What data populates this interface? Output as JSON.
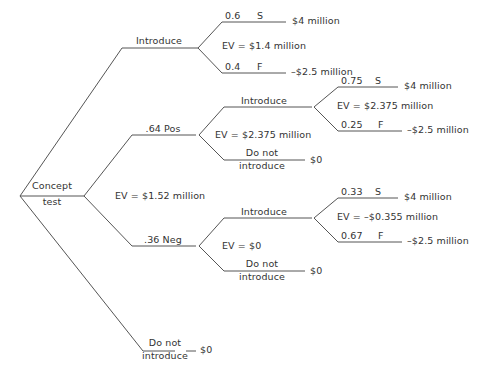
{
  "diagram": {
    "type": "decision-tree",
    "line_color": "#555555",
    "text_color": "#333333",
    "background": "#ffffff"
  },
  "nodes": {
    "root": {
      "label_line1": "Concept",
      "label_line2": "test"
    },
    "introduce_top": {
      "label": "Introduce"
    },
    "pos_branch": {
      "label": ".64 Pos"
    },
    "neg_branch": {
      "label": ".36 Neg"
    },
    "do_not_introduce_root": {
      "label_line1": "Do not",
      "label_line2": "introduce"
    },
    "introduce_pos": {
      "label": "Introduce"
    },
    "do_not_introduce_pos": {
      "label_line1": "Do not",
      "label_line2": "introduce"
    },
    "introduce_neg": {
      "label": "Introduce"
    },
    "do_not_introduce_neg": {
      "label_line1": "Do not",
      "label_line2": "introduce"
    }
  },
  "probabilities": {
    "no_test_success": "0.6",
    "no_test_failure": "0.4",
    "pos_success": "0.75",
    "pos_failure": "0.25",
    "neg_success": "0.33",
    "neg_failure": "0.67"
  },
  "outcome_codes": {
    "success": "S",
    "failure": "F"
  },
  "expected_values": {
    "no_test_introduce": "EV = $1.4 million",
    "concept_test": "EV = $1.52 million",
    "pos_decision": "EV = $2.375 million",
    "pos_introduce": "EV = $2.375 million",
    "neg_decision": "EV = $0",
    "neg_introduce": "EV = –$0.355 million"
  },
  "payoffs": {
    "no_test_success": "$4 million",
    "no_test_failure": "–$2.5 million",
    "pos_success": "$4 million",
    "pos_failure": "–$2.5 million",
    "pos_do_not_introduce": "$0",
    "neg_success": "$4 million",
    "neg_failure": "–$2.5 million",
    "neg_do_not_introduce": "$0",
    "root_do_not_introduce": "$0"
  }
}
